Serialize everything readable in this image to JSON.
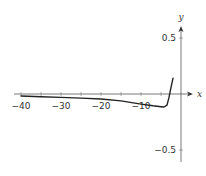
{
  "chart_data": {
    "type": "line",
    "title": "",
    "xlabel": "x",
    "ylabel": "y",
    "xlim": [
      -42,
      3
    ],
    "ylim": [
      -0.6,
      0.6
    ],
    "x_ticks": [
      -40,
      -35,
      -30,
      -25,
      -20,
      -15,
      -10,
      -5
    ],
    "x_tick_labels": [
      "−40",
      "−30",
      "−20",
      "−10"
    ],
    "x_tick_label_values": [
      -40,
      -30,
      -20,
      -10
    ],
    "y_ticks": [
      0.5,
      -0.5
    ],
    "y_tick_labels": [
      "0.5",
      "−0.5"
    ],
    "grid": false,
    "legend": null,
    "series": [
      {
        "name": "f(x)",
        "color": "#222222",
        "x": [
          -40,
          -35,
          -30,
          -25,
          -20,
          -15,
          -10,
          -7,
          -5,
          -4.25,
          -3.5,
          -3,
          -2.5,
          -2
        ],
        "y": [
          -0.018,
          -0.024,
          -0.03,
          -0.037,
          -0.045,
          -0.062,
          -0.09,
          -0.105,
          -0.113,
          -0.116,
          -0.1,
          -0.03,
          0.06,
          0.14
        ]
      }
    ]
  }
}
